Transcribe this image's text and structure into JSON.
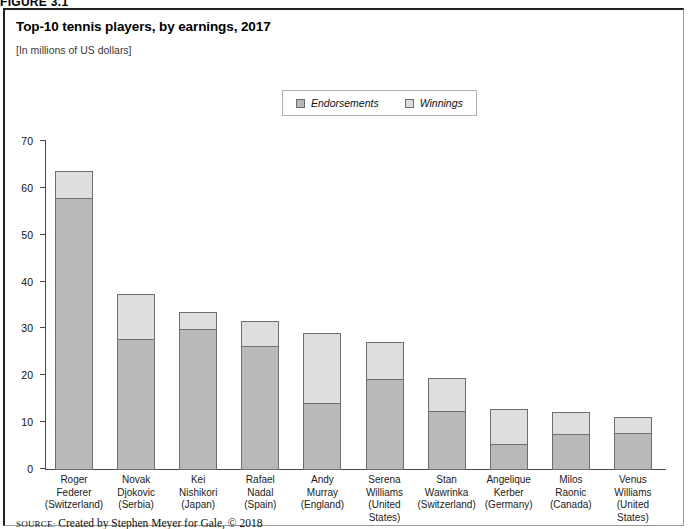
{
  "figure": {
    "label": "FIGURE 3.1"
  },
  "header": {
    "title": "Top-10 tennis players, by earnings, 2017",
    "subtitle": "[In millions of US dollars]"
  },
  "legend": {
    "items": [
      {
        "label": "Endorsements",
        "color": "#b9b9b9",
        "icon": "square-swatch-icon"
      },
      {
        "label": "Winnings",
        "color": "#dedede",
        "icon": "square-swatch-icon"
      }
    ]
  },
  "source": {
    "label": "SOURCE:",
    "text": "Created by Stephen Meyer for Gale, © 2018"
  },
  "axis": {
    "y_ticks": [
      "70",
      "60",
      "50",
      "40",
      "30",
      "20",
      "10",
      "0"
    ]
  },
  "chart_data": {
    "type": "bar",
    "subtype": "stacked-vertical",
    "title": "Top-10 tennis players, by earnings, 2017",
    "subtitle": "[In millions of US dollars]",
    "xlabel": "",
    "ylabel": "",
    "ylim": [
      0,
      70
    ],
    "ytick_step": 10,
    "grid": false,
    "legend_position": "top-center",
    "categories": [
      "Roger Federer (Switzerland)",
      "Novak Djokovic (Serbia)",
      "Kei Nishikori (Japan)",
      "Rafael Nadal (Spain)",
      "Andy Murray (England)",
      "Serena Williams (United States)",
      "Stan Wawrinka (Switzerland)",
      "Angelique Kerber (Germany)",
      "Milos Raonic (Canada)",
      "Venus Williams (United States)"
    ],
    "category_lines": [
      [
        "Roger",
        "Federer",
        "(Switzerland)"
      ],
      [
        "Novak",
        "Djokovic",
        "(Serbia)"
      ],
      [
        "Kei",
        "Nishikori",
        "(Japan)"
      ],
      [
        "Rafael",
        "Nadal",
        "(Spain)"
      ],
      [
        "Andy",
        "Murray",
        "(England)"
      ],
      [
        "Serena",
        "Williams",
        "(United States)"
      ],
      [
        "Stan",
        "Wawrinka",
        "(Switzerland)"
      ],
      [
        "Angelique",
        "Kerber",
        "(Germany)"
      ],
      [
        "Milos",
        "Raonic",
        "(Canada)"
      ],
      [
        "Venus",
        "Williams",
        "(United States)"
      ]
    ],
    "series": [
      {
        "name": "Endorsements",
        "color": "#b9b9b9",
        "values": [
          58.0,
          28.0,
          30.2,
          26.4,
          14.4,
          19.5,
          12.6,
          5.6,
          7.7,
          7.9
        ]
      },
      {
        "name": "Winnings",
        "color": "#dedede",
        "values": [
          6.0,
          9.8,
          3.8,
          5.6,
          15.0,
          8.0,
          7.2,
          7.7,
          4.9,
          3.6
        ]
      }
    ],
    "totals": [
      64.0,
      37.8,
      34.0,
      32.0,
      29.4,
      27.5,
      19.8,
      13.3,
      12.6,
      11.5
    ]
  }
}
